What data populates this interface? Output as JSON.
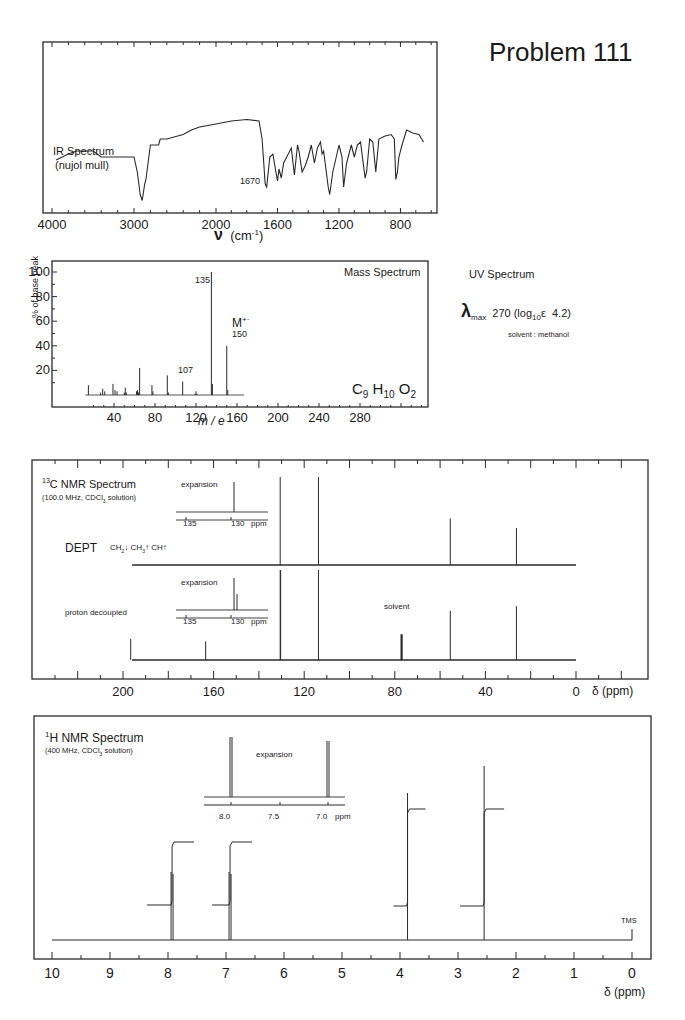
{
  "page": {
    "title": "Problem 111"
  },
  "ir": {
    "label_line1": "IR Spectrum",
    "label_line2": "(nujol mull)",
    "peak_label": "1670",
    "xaxis_label": "ν (cm⁻¹)",
    "xticks": [
      "4000",
      "3000",
      "2000",
      "1600",
      "1200",
      "800"
    ]
  },
  "mass": {
    "title": "Mass Spectrum",
    "ylabel": "% of base peak",
    "xlabel": "m / e",
    "formula": "C9H10O2",
    "yticks": [
      "100",
      "80",
      "60",
      "40",
      "20"
    ],
    "xticks": [
      "40",
      "80",
      "120",
      "160",
      "200",
      "240",
      "280"
    ],
    "label_135": "135",
    "label_107": "107",
    "label_m": "M+·",
    "label_150": "150"
  },
  "uv": {
    "title": "UV Spectrum",
    "lambda_max": "270",
    "log_eps": "4.2",
    "text": "270 (log10ε  4.2)",
    "solvent": "solvent : methanol"
  },
  "c13": {
    "title": "13C NMR Spectrum",
    "conditions": "(100.0 MHz, CDCl3 solution)",
    "dept_label": "DEPT",
    "dept_legend": "CH2↓ CH3↑ CH↑",
    "proton_decoupled": "proton decoupled",
    "solvent_label": "solvent",
    "expansion_label": "expansion",
    "expansion_ticks": [
      "135",
      "130",
      "ppm"
    ],
    "xticks": [
      "200",
      "160",
      "120",
      "80",
      "40",
      "0"
    ],
    "xaxis_label": "δ (ppm)"
  },
  "h1": {
    "title": "1H NMR Spectrum",
    "conditions": "(400 MHz, CDCl3 solution)",
    "expansion_label": "expansion",
    "expansion_ticks": [
      "8.0",
      "7.5",
      "7.0",
      "ppm"
    ],
    "tms_label": "TMS",
    "xticks": [
      "10",
      "9",
      "8",
      "7",
      "6",
      "5",
      "4",
      "3",
      "2",
      "1",
      "0"
    ],
    "xaxis_label": "δ (ppm)"
  },
  "chart_data": [
    {
      "type": "line",
      "title": "IR Spectrum (nujol mull)",
      "xlabel": "ν (cm⁻¹)",
      "ylabel": "transmittance",
      "xlim": [
        4000,
        600
      ],
      "annotations": [
        {
          "x": 1670,
          "text": "1670"
        }
      ],
      "x": [
        3950,
        3800,
        3700,
        3500,
        3400,
        3000,
        2960,
        2925,
        2900,
        2870,
        2855,
        2800,
        2700,
        2680,
        2600,
        2400,
        2300,
        2200,
        2000,
        1950,
        1900,
        1800,
        1720,
        1700,
        1680,
        1670,
        1650,
        1630,
        1610,
        1600,
        1590,
        1575,
        1560,
        1540,
        1510,
        1490,
        1470,
        1460,
        1440,
        1420,
        1400,
        1380,
        1360,
        1340,
        1320,
        1310,
        1300,
        1280,
        1270,
        1260,
        1240,
        1200,
        1180,
        1170,
        1150,
        1120,
        1110,
        1100,
        1080,
        1060,
        1030,
        1020,
        1000,
        980,
        960,
        940,
        900,
        860,
        840,
        830,
        820,
        810,
        790,
        760,
        720,
        680,
        650
      ],
      "y": [
        72,
        68,
        66,
        66,
        70,
        70,
        80,
        95,
        99,
        88,
        85,
        62,
        62,
        58,
        58,
        55,
        52,
        50,
        48,
        47,
        46,
        45,
        46,
        58,
        88,
        90,
        70,
        68,
        80,
        86,
        78,
        84,
        74,
        70,
        64,
        82,
        62,
        66,
        80,
        76,
        70,
        62,
        74,
        64,
        60,
        68,
        66,
        82,
        90,
        95,
        80,
        62,
        70,
        90,
        74,
        62,
        66,
        70,
        62,
        60,
        84,
        80,
        58,
        60,
        80,
        58,
        56,
        55,
        58,
        85,
        80,
        70,
        62,
        52,
        54,
        55,
        60
      ]
    },
    {
      "type": "bar",
      "title": "Mass Spectrum",
      "xlabel": "m / e",
      "ylabel": "% of base peak",
      "xlim": [
        0,
        320
      ],
      "ylim": [
        0,
        105
      ],
      "formula": "C9H10O2",
      "x": [
        15,
        27,
        29,
        31,
        39,
        41,
        43,
        50,
        51,
        52,
        62,
        63,
        64,
        65,
        77,
        78,
        92,
        93,
        107,
        119,
        120,
        121,
        135,
        136,
        150,
        151
      ],
      "values": [
        8,
        2,
        5,
        3,
        9,
        4,
        3,
        2,
        6,
        2,
        3,
        4,
        2,
        22,
        8,
        3,
        16,
        2,
        11,
        1,
        3,
        1,
        100,
        9,
        40,
        4
      ],
      "annotations": [
        {
          "x": 135,
          "text": "135"
        },
        {
          "x": 107,
          "text": "107"
        },
        {
          "x": 150,
          "text": "M+· 150"
        }
      ]
    },
    {
      "type": "line",
      "title": "13C NMR Spectrum (100.0 MHz, CDCl3 solution)",
      "xlabel": "δ (ppm)",
      "xlim": [
        220,
        -10
      ],
      "series": [
        {
          "name": "DEPT",
          "peaks_ppm": [
            130.6,
            113.7,
            55.5,
            26.3
          ],
          "heights": [
            100,
            100,
            53,
            42
          ]
        },
        {
          "name": "proton decoupled",
          "peaks_ppm": [
            196.6,
            163.5,
            130.6,
            130.4,
            113.7,
            77.0,
            55.5,
            26.3
          ],
          "heights": [
            18,
            16,
            34,
            100,
            100,
            24,
            42,
            46
          ]
        }
      ],
      "annotations": [
        {
          "x": 77.0,
          "text": "solvent"
        }
      ]
    },
    {
      "type": "line",
      "title": "1H NMR Spectrum (400 MHz, CDCl3 solution)",
      "xlabel": "δ (ppm)",
      "xlim": [
        10,
        0
      ],
      "peaks_ppm": [
        7.93,
        6.93,
        3.87,
        2.55,
        0.0
      ],
      "heights": [
        50,
        50,
        82,
        95,
        6
      ],
      "integrals": [
        2,
        2,
        3,
        3
      ],
      "multiplicity": [
        "d",
        "d",
        "s",
        "s",
        "s"
      ],
      "annotations": [
        {
          "x": 0.0,
          "text": "TMS"
        }
      ]
    }
  ]
}
